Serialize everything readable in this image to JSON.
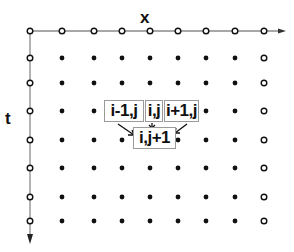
{
  "diagram": {
    "type": "finite-difference grid stencil",
    "axes": {
      "x_label": "x",
      "t_label": "t"
    },
    "grid": {
      "columns_x": [
        30,
        62,
        94,
        122,
        150,
        178,
        206,
        235,
        264
      ],
      "rows_y": [
        31,
        58,
        83,
        111,
        140,
        168,
        197,
        221
      ],
      "boundary_nodes": "hollow circles (top row, left column, right column)",
      "interior_nodes": "filled dots"
    },
    "stencil": {
      "labels": [
        "i-1,j",
        "i,j",
        "i+1,j"
      ],
      "target_label": "i,j+1"
    },
    "colors": {
      "axis": "#8a8a8a",
      "node": "#111111",
      "box_border": "#9a9a9a"
    }
  }
}
